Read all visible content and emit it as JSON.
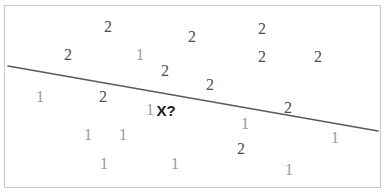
{
  "figure": {
    "name": "knn-decision-boundary-scatter",
    "background_color": "#ffffff",
    "frame_color": "#c8c8c8",
    "width": 387,
    "height": 196
  },
  "boundary_line": {
    "name": "decision-boundary",
    "color": "#5a5a5a",
    "width": 1.6,
    "x1": 8,
    "y1": 66,
    "x2": 378,
    "y2": 131
  },
  "query_point": {
    "label": "X?",
    "x": 166,
    "y": 110,
    "color": "#1a1a1a"
  },
  "legend_colors": {
    "class_1": "#9a9a9a",
    "class_2": "#4d4d4d"
  },
  "chart_data": {
    "type": "scatter",
    "title": "",
    "xlabel": "",
    "ylabel": "",
    "grid": false,
    "legend": "none",
    "xlim": [
      0,
      387
    ],
    "ylim": [
      0,
      196
    ],
    "annotations": [
      {
        "text": "X?",
        "x": 166,
        "y": 110
      }
    ],
    "series": [
      {
        "name": "1",
        "label": "1",
        "color": "#9a9a9a",
        "points": [
          {
            "label": "1",
            "x": 140,
            "y": 55
          },
          {
            "label": "1",
            "x": 40,
            "y": 97
          },
          {
            "label": "1",
            "x": 150,
            "y": 110
          },
          {
            "label": "1",
            "x": 245,
            "y": 124
          },
          {
            "label": "1",
            "x": 335,
            "y": 138
          },
          {
            "label": "1",
            "x": 88,
            "y": 135
          },
          {
            "label": "1",
            "x": 123,
            "y": 135
          },
          {
            "label": "1",
            "x": 104,
            "y": 164
          },
          {
            "label": "1",
            "x": 175,
            "y": 164
          },
          {
            "label": "1",
            "x": 289,
            "y": 170
          }
        ]
      },
      {
        "name": "2",
        "label": "2",
        "color": "#4d4d4d",
        "points": [
          {
            "label": "2",
            "x": 108,
            "y": 27
          },
          {
            "label": "2",
            "x": 192,
            "y": 37
          },
          {
            "label": "2",
            "x": 262,
            "y": 29
          },
          {
            "label": "2",
            "x": 68,
            "y": 55
          },
          {
            "label": "2",
            "x": 262,
            "y": 57
          },
          {
            "label": "2",
            "x": 318,
            "y": 57
          },
          {
            "label": "2",
            "x": 165,
            "y": 71
          },
          {
            "label": "2",
            "x": 210,
            "y": 85
          },
          {
            "label": "2",
            "x": 103,
            "y": 97
          },
          {
            "label": "2",
            "x": 288,
            "y": 108
          },
          {
            "label": "2",
            "x": 241,
            "y": 149
          }
        ]
      }
    ]
  }
}
